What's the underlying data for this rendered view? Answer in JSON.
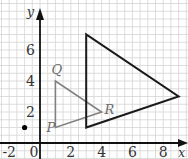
{
  "figure": {
    "type": "coordinate-grid-enlargement",
    "axes": {
      "x_label": "x",
      "y_label": "y",
      "x_ticks": [
        "-2",
        "0",
        "2",
        "4",
        "6",
        "8"
      ],
      "y_ticks": [
        "2",
        "4",
        "6"
      ],
      "x_range": [
        -2.5,
        9.5
      ],
      "y_range": [
        -0.5,
        8.5
      ],
      "grid_step": 0.5
    },
    "small_triangle": {
      "vertices": [
        {
          "label": "P",
          "x": 1,
          "y": 1
        },
        {
          "label": "Q",
          "x": 1,
          "y": 4
        },
        {
          "label": "R",
          "x": 4,
          "y": 2
        }
      ],
      "color": "#808080"
    },
    "large_triangle": {
      "vertices": [
        {
          "x": 3,
          "y": 7
        },
        {
          "x": 3,
          "y": 1
        },
        {
          "x": 9,
          "y": 3
        }
      ],
      "color": "#1a1a1a"
    },
    "center_point": {
      "x": -1,
      "y": 1,
      "color": "#000000"
    },
    "colors": {
      "grid": "#d4d4d4",
      "axis": "#111111",
      "background": "#ffffff"
    }
  }
}
